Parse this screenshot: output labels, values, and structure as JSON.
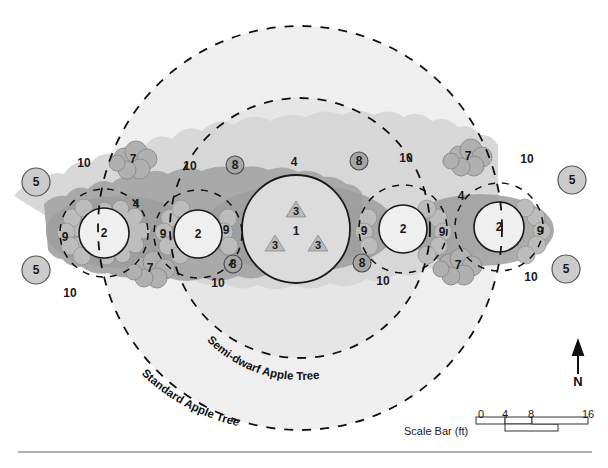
{
  "figure": {
    "type": "planting-plan",
    "orientation_label": "N",
    "scale_bar": {
      "label": "Scale Bar (ft)",
      "ticks": [
        "0",
        "4",
        "8",
        "16"
      ],
      "units": "ft"
    },
    "canopy_rings": [
      {
        "id": "semi-dwarf",
        "label": "Semi-dwarf Apple Tree"
      },
      {
        "id": "standard",
        "label": "Standard Apple Tree"
      }
    ]
  },
  "colors": {
    "paper": "#ffffff",
    "ink": "#1a1a1a",
    "ring_fill_outer": "#eeeeee",
    "ring_fill_inner": "#e4e4e4",
    "canopy_light": "#d0d0d0",
    "canopy_mid": "#a8a8a8",
    "canopy_dark": "#9a9a9a",
    "tree_fill": "#e6e6e6",
    "tree_fill_light": "#efefef",
    "shrub_fill": "#b4b4b4",
    "badge_fill": "#a9a9a9",
    "circle5_fill": "#c9c9c9",
    "triangle_fill": "#b9b9b9",
    "rule": "#b0b0b0"
  },
  "plants": {
    "1": "1",
    "2": "2",
    "3": "3",
    "4": "4",
    "5": "5",
    "7": "7",
    "8": "8",
    "9": "9",
    "10": "10"
  },
  "labels": [
    {
      "id": "l01",
      "text": "10",
      "x": 84,
      "y": 163,
      "kind": "n"
    },
    {
      "id": "l02",
      "text": "7",
      "x": 133,
      "y": 159,
      "kind": "n"
    },
    {
      "id": "l03",
      "text": "10",
      "x": 190,
      "y": 166,
      "kind": "n"
    },
    {
      "id": "l04",
      "text": "8",
      "x": 235,
      "y": 165,
      "kind": "circ"
    },
    {
      "id": "l05",
      "text": "4",
      "x": 294,
      "y": 162,
      "kind": "n"
    },
    {
      "id": "l06",
      "text": "8",
      "x": 359,
      "y": 161,
      "kind": "circ"
    },
    {
      "id": "l07",
      "text": "10",
      "x": 406,
      "y": 158,
      "kind": "n"
    },
    {
      "id": "l08",
      "text": "7",
      "x": 468,
      "y": 156,
      "kind": "n"
    },
    {
      "id": "l09",
      "text": "10",
      "x": 527,
      "y": 159,
      "kind": "n"
    },
    {
      "id": "l10",
      "text": "5",
      "x": 36,
      "y": 182,
      "kind": "circ"
    },
    {
      "id": "l11",
      "text": "5",
      "x": 572,
      "y": 180,
      "kind": "circ"
    },
    {
      "id": "l12",
      "text": "5",
      "x": 36,
      "y": 270,
      "kind": "circ"
    },
    {
      "id": "l13",
      "text": "5",
      "x": 566,
      "y": 269,
      "kind": "circ"
    },
    {
      "id": "l14",
      "text": "4",
      "x": 136,
      "y": 204,
      "kind": "n"
    },
    {
      "id": "l15",
      "text": "4",
      "x": 461,
      "y": 196,
      "kind": "n"
    },
    {
      "id": "l16",
      "text": "9",
      "x": 65,
      "y": 237,
      "kind": "n"
    },
    {
      "id": "l17",
      "text": "9",
      "x": 163,
      "y": 234,
      "kind": "n"
    },
    {
      "id": "l18",
      "text": "9",
      "x": 226,
      "y": 230,
      "kind": "n"
    },
    {
      "id": "l19",
      "text": "9",
      "x": 364,
      "y": 231,
      "kind": "n"
    },
    {
      "id": "l20",
      "text": "9",
      "x": 442,
      "y": 232,
      "kind": "n"
    },
    {
      "id": "l21",
      "text": "9",
      "x": 540,
      "y": 231,
      "kind": "n"
    },
    {
      "id": "l22",
      "text": "2",
      "x": 104,
      "y": 233,
      "kind": "n"
    },
    {
      "id": "l23",
      "text": "2",
      "x": 198,
      "y": 234,
      "kind": "n"
    },
    {
      "id": "l24",
      "text": "2",
      "x": 403,
      "y": 229,
      "kind": "n"
    },
    {
      "id": "l25",
      "text": "2",
      "x": 499,
      "y": 227,
      "kind": "n"
    },
    {
      "id": "l26",
      "text": "1",
      "x": 296,
      "y": 231,
      "kind": "ctr1"
    },
    {
      "id": "l27",
      "text": "3",
      "x": 296,
      "y": 211,
      "kind": "tri"
    },
    {
      "id": "l28",
      "text": "3",
      "x": 275,
      "y": 245,
      "kind": "tri"
    },
    {
      "id": "l29",
      "text": "3",
      "x": 318,
      "y": 245,
      "kind": "tri"
    },
    {
      "id": "l30",
      "text": "8",
      "x": 233,
      "y": 264,
      "kind": "circ"
    },
    {
      "id": "l31",
      "text": "8",
      "x": 362,
      "y": 263,
      "kind": "circ"
    },
    {
      "id": "l32",
      "text": "7",
      "x": 150,
      "y": 268,
      "kind": "n"
    },
    {
      "id": "l33",
      "text": "7",
      "x": 458,
      "y": 265,
      "kind": "n"
    },
    {
      "id": "l34",
      "text": "10",
      "x": 218,
      "y": 283,
      "kind": "n"
    },
    {
      "id": "l35",
      "text": "10",
      "x": 383,
      "y": 281,
      "kind": "n"
    },
    {
      "id": "l36",
      "text": "10",
      "x": 70,
      "y": 293,
      "kind": "n"
    },
    {
      "id": "l37",
      "text": "10",
      "x": 531,
      "y": 277,
      "kind": "n"
    }
  ],
  "scale_numbers": [
    {
      "text": "0",
      "x": 481,
      "y": 408
    },
    {
      "text": "4",
      "x": 505,
      "y": 408
    },
    {
      "text": "8",
      "x": 531,
      "y": 408
    },
    {
      "text": "16",
      "x": 588,
      "y": 408
    }
  ],
  "ring_labels": [
    {
      "id": "semi-dwarf-ring-label",
      "text": "Semi-dwarf Apple Tree"
    },
    {
      "id": "standard-ring-label",
      "text": "Standard Apple Tree"
    }
  ],
  "chart_data": {
    "type": "table",
    "xlabel": "",
    "ylabel": "",
    "annotations": [
      "Semi-dwarf Apple Tree",
      "Standard Apple Tree",
      "Scale Bar (ft)",
      "N"
    ],
    "categories": [
      "1",
      "2",
      "3",
      "4",
      "5",
      "7",
      "8",
      "9",
      "10"
    ],
    "values": [
      1,
      4,
      3,
      2,
      4,
      4,
      4,
      6,
      8
    ]
  }
}
